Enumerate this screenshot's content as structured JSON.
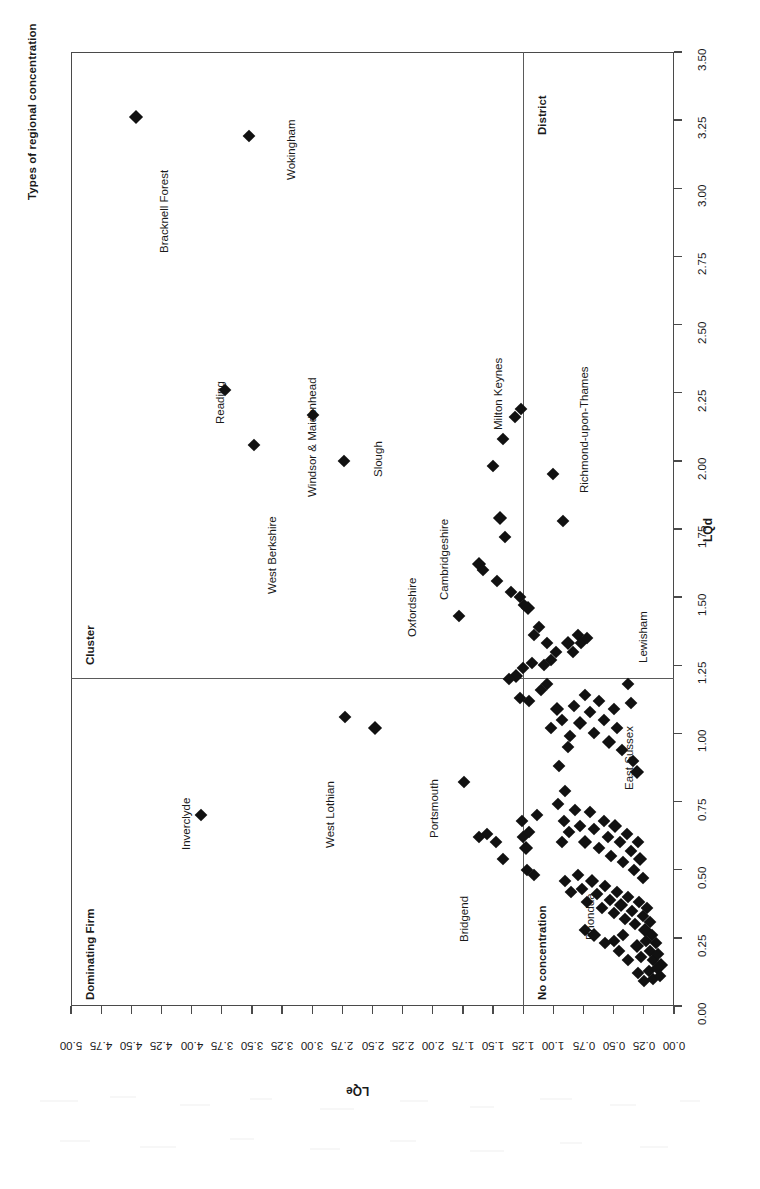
{
  "figure": {
    "title": "Types of regional concentration",
    "orientation": "rotated-90-ccw",
    "background": "#ffffff",
    "marker_color": "#111111",
    "frame_color": "#4a4a4a"
  },
  "axes": {
    "lqe": {
      "label": "LQe",
      "position": "bottom",
      "direction": "descending-left-to-right",
      "min": 0.0,
      "max": 5.0,
      "step": 0.25,
      "ticks": [
        "5.00",
        "4.75",
        "4.50",
        "4.25",
        "4.00",
        "3.75",
        "3.50",
        "3.25",
        "3.00",
        "2.75",
        "2.50",
        "2.25",
        "2.00",
        "1.75",
        "1.50",
        "1.25",
        "1.00",
        "0.75",
        "0.50",
        "0.25",
        "0.00"
      ]
    },
    "lqd": {
      "label": "LQd",
      "position": "right",
      "direction": "ascending-bottom-to-top",
      "min": 0.0,
      "max": 3.5,
      "step": 0.25,
      "ticks": [
        "0.00",
        "0.25",
        "0.50",
        "0.75",
        "1.00",
        "1.25",
        "1.50",
        "1.75",
        "2.00",
        "2.25",
        "2.50",
        "2.75",
        "3.00",
        "3.25",
        "3.50"
      ]
    }
  },
  "dividers": {
    "lqe_threshold": 1.25,
    "lqd_threshold": 1.25
  },
  "quadrants": [
    {
      "name": "Dominating Firm",
      "label": "Dominating Firm",
      "lqe": "high",
      "lqd": "low"
    },
    {
      "name": "Cluster",
      "label": "Cluster",
      "lqe": "high",
      "lqd": "high"
    },
    {
      "name": "No concentration",
      "label": "No concentration",
      "lqe": "low",
      "lqd": "low"
    },
    {
      "name": "District",
      "label": "District",
      "lqe": "low",
      "lqd": "high"
    }
  ],
  "chart_data": {
    "type": "scatter",
    "title": "Types of regional concentration",
    "xlabel": "LQe",
    "ylabel": "LQd",
    "xlim": [
      5.0,
      0.0
    ],
    "ylim": [
      0.0,
      3.5
    ],
    "grid": false,
    "legend": false,
    "reference_lines": {
      "x": 1.25,
      "y": 1.25
    },
    "quadrant_names": [
      "Dominating Firm",
      "Cluster",
      "No concentration",
      "District"
    ],
    "annotations": [
      "Bracknell Forest",
      "Wokingham",
      "Reading",
      "West Berkshire",
      "Windsor & Maidenhead",
      "Slough",
      "Oxfordshire",
      "Cambridgeshire",
      "Milton Keynes",
      "Richmond-upon-Thames",
      "Inverclyde",
      "West Lothian",
      "Portsmouth",
      "Bridgend",
      "Lewisham",
      "East Sussex",
      "Rhondda"
    ],
    "labelled_points": [
      {
        "name": "Bracknell Forest",
        "lqe": 4.46,
        "lqd": 3.26
      },
      {
        "name": "Wokingham",
        "lqe": 3.52,
        "lqd": 3.19
      },
      {
        "name": "Reading",
        "lqe": 3.72,
        "lqd": 2.26
      },
      {
        "name": "West Berkshire",
        "lqe": 3.48,
        "lqd": 2.06
      },
      {
        "name": "Windsor & Maidenhead",
        "lqe": 2.99,
        "lqd": 2.17
      },
      {
        "name": "Slough",
        "lqe": 2.74,
        "lqd": 2.0
      },
      {
        "name": "Oxfordshire",
        "lqe": 1.78,
        "lqd": 1.43
      },
      {
        "name": "Cambridgeshire",
        "lqe": 1.62,
        "lqd": 1.62
      },
      {
        "name": "Milton Keynes",
        "lqe": 1.27,
        "lqd": 2.19
      },
      {
        "name": "Richmond-upon-Thames",
        "lqe": 1.0,
        "lqd": 1.95
      },
      {
        "name": "Inverclyde",
        "lqe": 3.92,
        "lqd": 0.7
      },
      {
        "name": "West Lothian",
        "lqe": 2.73,
        "lqd": 1.06
      },
      {
        "name": "Portsmouth",
        "lqe": 1.74,
        "lqd": 0.82
      },
      {
        "name": "Bridgend",
        "lqe": 1.42,
        "lqd": 0.54
      },
      {
        "name": "Lewisham",
        "lqe": 0.8,
        "lqd": 1.36
      },
      {
        "name": "East Sussex",
        "lqe": 0.36,
        "lqd": 1.11
      },
      {
        "name": "Rhondda",
        "lqe": 0.57,
        "lqd": 0.23
      }
    ],
    "points": [
      [
        4.46,
        3.26
      ],
      [
        3.52,
        3.19
      ],
      [
        3.72,
        2.26
      ],
      [
        3.48,
        2.06
      ],
      [
        2.99,
        2.17
      ],
      [
        2.74,
        2.0
      ],
      [
        1.78,
        1.43
      ],
      [
        1.62,
        1.62
      ],
      [
        1.58,
        1.6
      ],
      [
        1.27,
        2.19
      ],
      [
        1.32,
        2.16
      ],
      [
        1.42,
        2.08
      ],
      [
        1.5,
        1.98
      ],
      [
        1.0,
        1.95
      ],
      [
        1.44,
        1.79
      ],
      [
        1.4,
        1.72
      ],
      [
        1.47,
        1.56
      ],
      [
        1.35,
        1.52
      ],
      [
        0.92,
        1.78
      ],
      [
        1.28,
        1.5
      ],
      [
        1.24,
        1.47
      ],
      [
        1.21,
        1.46
      ],
      [
        1.12,
        1.39
      ],
      [
        1.16,
        1.36
      ],
      [
        1.05,
        1.33
      ],
      [
        0.98,
        1.3
      ],
      [
        1.02,
        1.27
      ],
      [
        0.8,
        1.36
      ],
      [
        0.88,
        1.33
      ],
      [
        0.84,
        1.3
      ],
      [
        0.77,
        1.33
      ],
      [
        0.72,
        1.35
      ],
      [
        1.18,
        1.26
      ],
      [
        1.08,
        1.25
      ],
      [
        1.25,
        1.24
      ],
      [
        1.31,
        1.21
      ],
      [
        1.37,
        1.2
      ],
      [
        1.28,
        1.13
      ],
      [
        1.2,
        1.12
      ],
      [
        1.1,
        1.16
      ],
      [
        3.92,
        0.7
      ],
      [
        2.73,
        1.06
      ],
      [
        2.48,
        1.02
      ],
      [
        1.74,
        0.82
      ],
      [
        1.55,
        0.63
      ],
      [
        1.42,
        0.54
      ],
      [
        1.62,
        0.62
      ],
      [
        1.48,
        0.6
      ],
      [
        1.25,
        0.62
      ],
      [
        1.23,
        0.58
      ],
      [
        1.2,
        0.64
      ],
      [
        1.22,
        0.5
      ],
      [
        1.26,
        0.68
      ],
      [
        1.16,
        0.48
      ],
      [
        1.14,
        0.7
      ],
      [
        1.05,
        1.18
      ],
      [
        0.97,
        1.09
      ],
      [
        1.02,
        1.02
      ],
      [
        0.93,
        1.05
      ],
      [
        0.88,
        0.95
      ],
      [
        0.95,
        0.88
      ],
      [
        0.9,
        0.79
      ],
      [
        0.83,
        1.1
      ],
      [
        0.78,
        1.04
      ],
      [
        0.86,
        0.99
      ],
      [
        0.74,
        1.14
      ],
      [
        0.7,
        1.08
      ],
      [
        0.66,
        1.0
      ],
      [
        0.62,
        1.12
      ],
      [
        0.58,
        1.05
      ],
      [
        0.54,
        0.97
      ],
      [
        0.5,
        1.09
      ],
      [
        0.47,
        1.02
      ],
      [
        0.43,
        0.94
      ],
      [
        0.38,
        1.18
      ],
      [
        0.36,
        1.11
      ],
      [
        0.34,
        0.9
      ],
      [
        0.31,
        0.86
      ],
      [
        0.96,
        0.74
      ],
      [
        0.91,
        0.68
      ],
      [
        0.87,
        0.64
      ],
      [
        0.93,
        0.6
      ],
      [
        0.82,
        0.72
      ],
      [
        0.78,
        0.66
      ],
      [
        0.74,
        0.6
      ],
      [
        0.7,
        0.71
      ],
      [
        0.66,
        0.65
      ],
      [
        0.62,
        0.58
      ],
      [
        0.58,
        0.68
      ],
      [
        0.55,
        0.62
      ],
      [
        0.52,
        0.55
      ],
      [
        0.49,
        0.66
      ],
      [
        0.45,
        0.6
      ],
      [
        0.42,
        0.53
      ],
      [
        0.39,
        0.63
      ],
      [
        0.36,
        0.57
      ],
      [
        0.33,
        0.5
      ],
      [
        0.3,
        0.6
      ],
      [
        0.28,
        0.54
      ],
      [
        0.26,
        0.47
      ],
      [
        0.9,
        0.46
      ],
      [
        0.85,
        0.42
      ],
      [
        0.8,
        0.48
      ],
      [
        0.76,
        0.43
      ],
      [
        0.72,
        0.38
      ],
      [
        0.68,
        0.46
      ],
      [
        0.64,
        0.41
      ],
      [
        0.6,
        0.36
      ],
      [
        0.57,
        0.44
      ],
      [
        0.53,
        0.39
      ],
      [
        0.5,
        0.34
      ],
      [
        0.47,
        0.42
      ],
      [
        0.44,
        0.37
      ],
      [
        0.41,
        0.32
      ],
      [
        0.38,
        0.4
      ],
      [
        0.35,
        0.35
      ],
      [
        0.32,
        0.3
      ],
      [
        0.29,
        0.38
      ],
      [
        0.26,
        0.33
      ],
      [
        0.24,
        0.28
      ],
      [
        0.22,
        0.36
      ],
      [
        0.2,
        0.31
      ],
      [
        0.18,
        0.26
      ],
      [
        0.57,
        0.23
      ],
      [
        0.46,
        0.2
      ],
      [
        0.38,
        0.17
      ],
      [
        0.31,
        0.22
      ],
      [
        0.27,
        0.18
      ],
      [
        0.23,
        0.24
      ],
      [
        0.2,
        0.2
      ],
      [
        0.17,
        0.17
      ],
      [
        0.15,
        0.23
      ],
      [
        0.13,
        0.19
      ],
      [
        0.11,
        0.15
      ],
      [
        0.3,
        0.12
      ],
      [
        0.25,
        0.09
      ],
      [
        0.21,
        0.13
      ],
      [
        0.17,
        0.1
      ],
      [
        0.14,
        0.14
      ],
      [
        0.12,
        0.11
      ],
      [
        0.66,
        0.26
      ],
      [
        0.74,
        0.28
      ],
      [
        0.5,
        0.24
      ],
      [
        0.42,
        0.26
      ]
    ]
  }
}
